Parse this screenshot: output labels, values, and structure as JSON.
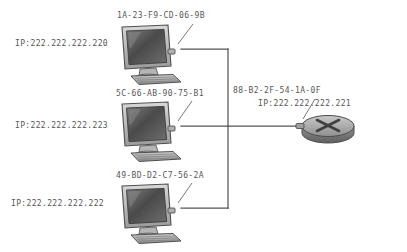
{
  "diagram": {
    "type": "network-topology",
    "background_color": "#ffffff",
    "line_color": "#555555",
    "text_color": "#575757"
  },
  "nodes": [
    {
      "id": "pc1",
      "kind": "computer",
      "icon": "crt-computer-icon",
      "mac": "1A-23-F9-CD-06-9B",
      "ip": "IP:222.222.222.220"
    },
    {
      "id": "pc2",
      "kind": "computer",
      "icon": "crt-computer-icon",
      "mac": "5C-66-AB-90-75-B1",
      "ip": "IP:222.222.222.223"
    },
    {
      "id": "pc3",
      "kind": "computer",
      "icon": "crt-computer-icon",
      "mac": "49-BD-D2-C7-56-2A",
      "ip": "IP:222.222.222.222"
    },
    {
      "id": "router1",
      "kind": "router",
      "icon": "router-icon",
      "mac": "88-B2-2F-54-1A-0F",
      "ip": "IP:222.222.222.221"
    }
  ],
  "links": [
    {
      "from": "pc1",
      "to": "bus"
    },
    {
      "from": "pc2",
      "to": "bus"
    },
    {
      "from": "pc3",
      "to": "bus"
    },
    {
      "from": "bus",
      "to": "router1"
    }
  ]
}
